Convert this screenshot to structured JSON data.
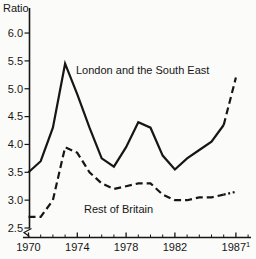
{
  "page": {
    "background": "#fbfbf9",
    "ink": "#161616"
  },
  "chart_data": {
    "type": "line",
    "title": "",
    "ylabel": "Ratio",
    "xlabel": "",
    "grid": false,
    "legend_position": "inline-labels-on-plot",
    "axis_break_bottom_left": true,
    "ylim": [
      2.5,
      6.2
    ],
    "xlim": [
      1970,
      1988
    ],
    "y_ticks": [
      "2.5",
      "3.0",
      "3.5",
      "4.0",
      "4.5",
      "5.0",
      "5.5",
      "6.0"
    ],
    "x_minor_years": [
      1970,
      1971,
      1972,
      1973,
      1974,
      1975,
      1976,
      1977,
      1978,
      1979,
      1980,
      1981,
      1982,
      1983,
      1984,
      1985,
      1986,
      1987,
      1988
    ],
    "x_major_ticks": [
      {
        "year": 1970,
        "label": "1970"
      },
      {
        "year": 1974,
        "label": "1974"
      },
      {
        "year": 1978,
        "label": "1978"
      },
      {
        "year": 1982,
        "label": "1982"
      },
      {
        "year": 1987,
        "label": "1987",
        "sup": "1"
      }
    ],
    "x": [
      1970,
      1971,
      1972,
      1973,
      1974,
      1975,
      1976,
      1977,
      1978,
      1979,
      1980,
      1981,
      1982,
      1983,
      1984,
      1985,
      1986,
      1987
    ],
    "series": [
      {
        "name": "London and the South East",
        "line_style": "solid",
        "projection": {
          "from_x": 1986,
          "style": "dashed"
        },
        "values": [
          3.5,
          3.7,
          4.3,
          5.45,
          4.9,
          4.3,
          3.75,
          3.6,
          3.95,
          4.4,
          4.3,
          3.8,
          3.55,
          3.75,
          3.9,
          4.05,
          4.35,
          5.2
        ]
      },
      {
        "name": "Rest of Britain",
        "line_style": "dashed",
        "projection": {
          "from_x": 1986,
          "style": "dotted"
        },
        "values": [
          2.7,
          2.7,
          3.0,
          3.95,
          3.85,
          3.5,
          3.3,
          3.2,
          3.25,
          3.3,
          3.3,
          3.1,
          3.0,
          3.0,
          3.05,
          3.05,
          3.1,
          3.15
        ]
      }
    ]
  }
}
